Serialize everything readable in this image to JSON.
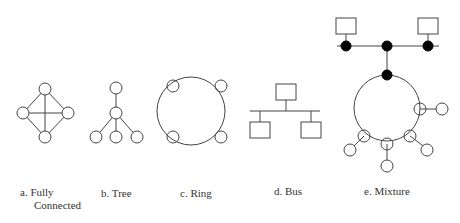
{
  "figure": {
    "panels": [
      {
        "id": "a",
        "prefix": "a.",
        "title": "Fully",
        "title_line2": "Connected"
      },
      {
        "id": "b",
        "prefix": "b.",
        "title": "Tree"
      },
      {
        "id": "c",
        "prefix": "c.",
        "title": "Ring"
      },
      {
        "id": "d",
        "prefix": "d.",
        "title": "Bus"
      },
      {
        "id": "e",
        "prefix": "e.",
        "title": "Mixture"
      }
    ],
    "colors": {
      "stroke": "#444444",
      "fill_node": "#ffffff",
      "fill_hub": "#000000"
    }
  }
}
